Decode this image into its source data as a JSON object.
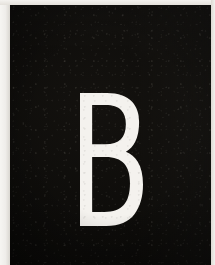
{
  "image": {
    "kind": "photographic-scan",
    "subject": "single printed capital letter specimen on a dark plate",
    "alt_text": "Scan of a dark, grainy card bearing a large white capital letter B",
    "width_px": 215,
    "height_px": 265
  },
  "glyph": {
    "character": "B",
    "case": "uppercase",
    "color": "#f4f2ee",
    "style": "bold sans-serif",
    "bounds_px": {
      "x": 80,
      "y": 93,
      "width": 63,
      "height": 133
    },
    "counters": 2
  },
  "plate": {
    "label": "dark-plate",
    "background_color": "#0b0a08",
    "highlight_color": "#16140f",
    "texture": "film-grain",
    "bounds_px": {
      "x": 10,
      "y": 5,
      "width": 201,
      "height": 260
    }
  },
  "margins": {
    "left": {
      "label": "left-margin",
      "color": "#efedea",
      "width_px": 10
    },
    "top": {
      "label": "top-margin",
      "color": "#e9e6e1",
      "height_px": 5
    },
    "right": {
      "label": "right-margin",
      "color": "#e7e4df",
      "width_px": 4
    },
    "bottom": {
      "label": "bottom-edge",
      "color": "#0b0a08",
      "height_px": 0
    }
  }
}
